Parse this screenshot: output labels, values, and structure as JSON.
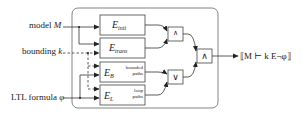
{
  "inputs": {
    "model": "model M",
    "model_prefix": "model ",
    "model_var": "M",
    "bound": "bounding k",
    "bound_prefix": "bounding ",
    "bound_var": "k",
    "formula": "LTL formula φ",
    "formula_prefix": "LTL formula ",
    "formula_var": "φ"
  },
  "blocks": {
    "init": {
      "base": "E",
      "sub": "init"
    },
    "trans": {
      "base": "E",
      "sub": "trans"
    },
    "bounded": {
      "base": "E",
      "sub": "B",
      "note1": "bounded",
      "note2": "paths"
    },
    "loop": {
      "base": "E",
      "sub": "L",
      "note1": "loop",
      "note2": "paths"
    }
  },
  "gates": {
    "top": "∧",
    "or": "∨",
    "final": "∧"
  },
  "output": "⟦M ⊢ k E¬φ⟧",
  "colors": {
    "stroke": "#333333",
    "frame": "#666666",
    "background": "#ffffff"
  }
}
